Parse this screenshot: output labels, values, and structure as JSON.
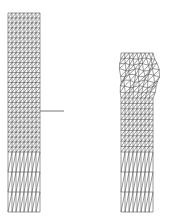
{
  "figure": {
    "width": 186,
    "height": 222,
    "background": "#ffffff",
    "stroke_color": "#555555",
    "crack_color": "#666666"
  },
  "left_mesh": {
    "label": "undeformed-mesh",
    "x0": 8,
    "x1": 40,
    "y0": 13,
    "y1": 212,
    "cols": 4,
    "fine_rows_top": 14,
    "fine_y_end": 152,
    "coarse_rows": 3
  },
  "crack": {
    "x0": 40,
    "y0": 111,
    "x1": 64,
    "y1": 111
  },
  "right_mesh": {
    "label": "deformed-mesh",
    "x0": 121,
    "x1": 153,
    "y0": 53,
    "y1": 212,
    "distorted_y_end": 98,
    "bulge": 6
  }
}
